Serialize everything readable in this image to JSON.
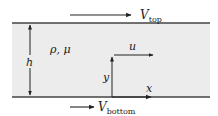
{
  "diagram": {
    "colors": {
      "fluid_fill": "#ececec",
      "plate_line": "#444444",
      "arrow": "#222222",
      "text": "#222222"
    },
    "labels": {
      "v_top_main": "V",
      "v_top_sub": "top",
      "v_bottom_main": "V",
      "v_bottom_sub": "bottom",
      "properties": "ρ, μ",
      "height": "h",
      "y_axis": "y",
      "x_axis": "x",
      "velocity": "u"
    }
  }
}
